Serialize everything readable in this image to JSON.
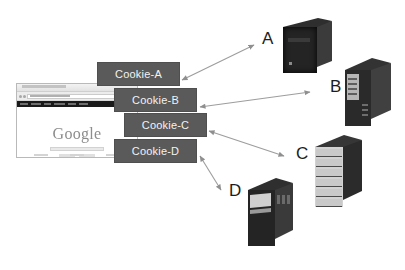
{
  "diagram": {
    "background_color": "#ffffff",
    "cookie_box_color": "#5a5a5a",
    "cookie_text_color": "#f2f2f2",
    "arrow_color": "#9a9a9a",
    "label_color": "#1d1d1d"
  },
  "browser": {
    "page_logo": "Google",
    "window_name": "browser-window"
  },
  "cookies": [
    {
      "id": "cookie-a",
      "label": "Cookie-A"
    },
    {
      "id": "cookie-b",
      "label": "Cookie-B"
    },
    {
      "id": "cookie-c",
      "label": "Cookie-C"
    },
    {
      "id": "cookie-d",
      "label": "Cookie-D"
    }
  ],
  "servers": [
    {
      "id": "server-a",
      "label": "A",
      "type": "desktop-tower"
    },
    {
      "id": "server-b",
      "label": "B",
      "type": "tower-server"
    },
    {
      "id": "server-c",
      "label": "C",
      "type": "rack-server"
    },
    {
      "id": "server-d",
      "label": "D",
      "type": "tower-server"
    }
  ],
  "connections": [
    {
      "from": "cookie-a",
      "to": "server-a",
      "style": "double-headed-arrow"
    },
    {
      "from": "cookie-b",
      "to": "server-b",
      "style": "double-headed-arrow"
    },
    {
      "from": "cookie-c",
      "to": "server-c",
      "style": "double-headed-arrow"
    },
    {
      "from": "cookie-d",
      "to": "server-d",
      "style": "double-headed-arrow"
    }
  ]
}
